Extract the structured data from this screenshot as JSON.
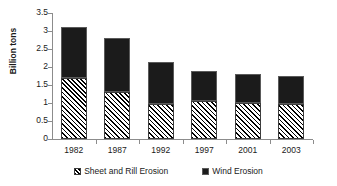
{
  "chart_data": {
    "type": "bar",
    "stacked": true,
    "title": "",
    "xlabel": "",
    "ylabel": "Billion tons",
    "categories": [
      "1982",
      "1987",
      "1992",
      "1997",
      "2001",
      "2003"
    ],
    "series": [
      {
        "name": "Sheet and Rill Erosion",
        "color": "#ffffff",
        "pattern": "diagonal-hatch",
        "values": [
          1.7,
          1.3,
          0.97,
          1.05,
          1.0,
          0.97
        ]
      },
      {
        "name": "Wind Erosion",
        "color": "#1b1b1b",
        "pattern": "solid",
        "values": [
          1.4,
          1.5,
          1.18,
          0.85,
          0.8,
          0.78
        ]
      }
    ],
    "totals": [
      3.1,
      2.8,
      2.15,
      1.9,
      1.8,
      1.75
    ],
    "ylim": [
      0,
      3.5
    ],
    "y_ticks": [
      "0",
      "0.5",
      "1",
      "1.5",
      "2",
      "2.5",
      "3",
      "3.5"
    ],
    "y_tick_values": [
      0,
      0.5,
      1,
      1.5,
      2,
      2.5,
      3,
      3.5
    ],
    "grid": false,
    "legend_position": "bottom"
  },
  "legend": {
    "entries": [
      {
        "label": "Sheet and Rill Erosion"
      },
      {
        "label": "Wind Erosion"
      }
    ]
  }
}
